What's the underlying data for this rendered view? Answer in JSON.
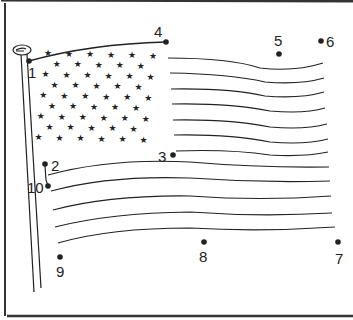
{
  "worksheet": {
    "title": "Connect the dots - flag",
    "colors": {
      "ink": "#222222",
      "paper": "#ffffff",
      "border": "#333333"
    },
    "dots": [
      {
        "n": "1",
        "x": 29,
        "y": 61,
        "lx": 28,
        "ly": 78
      },
      {
        "n": "2",
        "x": 45,
        "y": 164,
        "lx": 51,
        "ly": 171
      },
      {
        "n": "3",
        "x": 173,
        "y": 155,
        "lx": 158,
        "ly": 162
      },
      {
        "n": "4",
        "x": 166,
        "y": 42,
        "lx": 154,
        "ly": 37
      },
      {
        "n": "5",
        "x": 279,
        "y": 54,
        "lx": 274,
        "ly": 46
      },
      {
        "n": "6",
        "x": 321,
        "y": 41,
        "lx": 326,
        "ly": 47
      },
      {
        "n": "7",
        "x": 338,
        "y": 242,
        "lx": 335,
        "ly": 264
      },
      {
        "n": "8",
        "x": 204,
        "y": 242,
        "lx": 199,
        "ly": 262
      },
      {
        "n": "9",
        "x": 60,
        "y": 257,
        "lx": 56,
        "ly": 277
      },
      {
        "n": "10",
        "x": 48,
        "y": 186,
        "lx": 27,
        "ly": 193
      }
    ],
    "star_count": 50
  }
}
